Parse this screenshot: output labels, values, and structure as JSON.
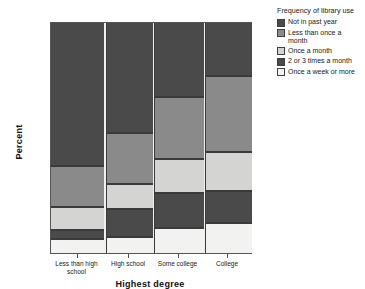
{
  "chart_data": {
    "type": "bar",
    "subtype": "stacked-percentage",
    "title": "",
    "xlabel": "Highest degree",
    "ylabel": "Percent",
    "ylim": [
      0,
      100
    ],
    "yticks": [
      "0%",
      "20%",
      "40%",
      "60%",
      "80%",
      "100%"
    ],
    "ytick_values": [
      0,
      20,
      40,
      60,
      80,
      100
    ],
    "grid": false,
    "legend_position": "right",
    "legend_title": "Frequency of library use",
    "categories": [
      "Less than high school",
      "High school",
      "Some college",
      "College"
    ],
    "category_widths": [
      53,
      46,
      49,
      46
    ],
    "series": [
      {
        "name": "Once a week or more",
        "values": [
          6,
          7,
          11,
          13
        ],
        "color": "#f2f2f0"
      },
      {
        "name": "2 or 3 times a month",
        "values": [
          4,
          12,
          15,
          14
        ],
        "color": "#4a4a4a"
      },
      {
        "name": "Once a month",
        "values": [
          10,
          11,
          15,
          17
        ],
        "color": "#d4d4d2"
      },
      {
        "name": "Less than once a month",
        "values": [
          18,
          22,
          27,
          33
        ],
        "color": "#8a8a8a"
      },
      {
        "name": "Not in past year",
        "values": [
          62,
          48,
          32,
          23
        ],
        "color": "#4a4a4a"
      }
    ],
    "stack_order_bottom_to_top": [
      "Once a week or more",
      "2 or 3 times a month",
      "Once a month",
      "Less than once a month",
      "Not in past year"
    ]
  },
  "legend": {
    "title": "Frequency of library use",
    "items": [
      {
        "label": "Not in past year",
        "color": "#4a4a4a"
      },
      {
        "label": "Less than once a\nmonth",
        "color": "#8a8a8a"
      },
      {
        "label": "Once a month",
        "color": "#d4d4d2"
      },
      {
        "label": "2 or 3 times a month",
        "color": "#4a4a4a"
      },
      {
        "label": "Once a week or more",
        "color": "#f2f2f0"
      }
    ]
  },
  "axes": {
    "y_title": "Percent",
    "x_title": "Highest degree",
    "y_ticks": [
      {
        "label": "100%",
        "value": 100
      },
      {
        "label": "80%",
        "value": 80
      },
      {
        "label": "60%",
        "value": 60
      },
      {
        "label": "40%",
        "value": 40
      },
      {
        "label": "20%",
        "value": 20
      },
      {
        "label": "0%",
        "value": 0
      }
    ],
    "x_ticks": [
      {
        "label": "Less than high\nschool"
      },
      {
        "label": "High school"
      },
      {
        "label": "Some college"
      },
      {
        "label": "College"
      }
    ]
  },
  "colors": {
    "plot_background": "#f0f0ee",
    "plot_border": "#555555",
    "page_background": "#ffffff",
    "segment_border": "#3a3a3a",
    "text": "#1a1a1a"
  }
}
